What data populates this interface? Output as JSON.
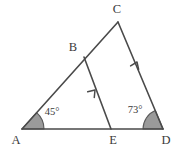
{
  "figure": {
    "width": 178,
    "height": 156,
    "background_color": "#ffffff",
    "stroke_color": "#4a4a4a",
    "angle_fill_color": "#9a9a9a",
    "angle_stroke_color": "#5a5a5a",
    "text_color": "#3a3a3a",
    "stroke_width": 1.6
  },
  "points": [
    {
      "id": "A",
      "label": "A",
      "x": 22,
      "y": 129,
      "label_x": 16,
      "label_y": 141
    },
    {
      "id": "B",
      "label": "B",
      "x": 84,
      "y": 57,
      "label_x": 73,
      "label_y": 48
    },
    {
      "id": "C",
      "label": "C",
      "x": 118,
      "y": 22,
      "label_x": 117,
      "label_y": 10
    },
    {
      "id": "D",
      "label": "D",
      "x": 163,
      "y": 129,
      "label_x": 166,
      "label_y": 141
    },
    {
      "id": "E",
      "label": "E",
      "x": 111,
      "y": 129,
      "label_x": 113,
      "label_y": 141
    }
  ],
  "segments": [
    {
      "id": "AC",
      "from": "A",
      "to": "C",
      "mark": "none",
      "description": "side A to C passing through B"
    },
    {
      "id": "CD",
      "from": "C",
      "to": "D",
      "mark": "arrow",
      "description": "side C to D with single arrowhead"
    },
    {
      "id": "AD",
      "from": "A",
      "to": "D",
      "mark": "none",
      "description": "base A to D passing through E"
    },
    {
      "id": "BE",
      "from": "E",
      "to": "B",
      "mark": "arrow",
      "description": "segment E to B with single arrowhead, parallel to CD"
    }
  ],
  "angles": [
    {
      "id": "angle-A",
      "vertex": "A",
      "value": "45°",
      "degrees": 45,
      "radius": 22,
      "label_x": 52,
      "label_y": 113
    },
    {
      "id": "angle-D",
      "vertex": "D",
      "value": "73°",
      "degrees": 73,
      "radius": 20,
      "label_x": 135,
      "label_y": 111
    }
  ],
  "parallel_marks": [
    {
      "id": "mark-be",
      "on_segment": "BE",
      "x": 95,
      "y": 90,
      "angle_deg": -49,
      "count": 1
    },
    {
      "id": "mark-cd",
      "on_segment": "CD",
      "x": 137,
      "y": 62,
      "angle_deg": -67,
      "count": 1
    }
  ]
}
